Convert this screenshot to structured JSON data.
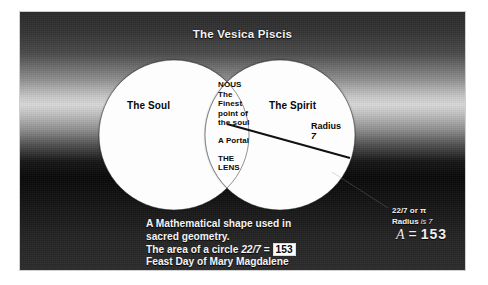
{
  "title": "The Vesica Piscis",
  "diagram": {
    "left_circle_label": "The Soul",
    "right_circle_label": "The Spirit",
    "radius_label": "Radius",
    "radius_value": "7",
    "lens": {
      "line1": "NOUS",
      "line2": "The",
      "line3": "Finest",
      "line4": "point of",
      "line5": "the soul",
      "line6": "A Portal",
      "line7": "THE",
      "line8": "LENS"
    }
  },
  "description": {
    "line1": "A Mathematical shape used in",
    "line2": "sacred geometry.",
    "line3_prefix": "The area of a circle ",
    "line3_fraction": "22/7",
    "line3_dash": " =",
    "line3_highlight": "153",
    "line4": "Feast Day of Mary Magdalene"
  },
  "math": {
    "pi_line": "22/7 or π",
    "radius_line_prefix": "Radius",
    "radius_line_italic": " is ",
    "radius_line_value": "7",
    "formula_var": "A",
    "formula_eq": "=",
    "formula_value": "153"
  },
  "colors": {
    "panel_dark": "#080808",
    "panel_light": "#d8d8d8",
    "circle_fill": "#fdfdfd",
    "text_light": "#f4f4f4",
    "text_dark": "#0a0a0a",
    "highlight_bg": "#ffffff"
  }
}
